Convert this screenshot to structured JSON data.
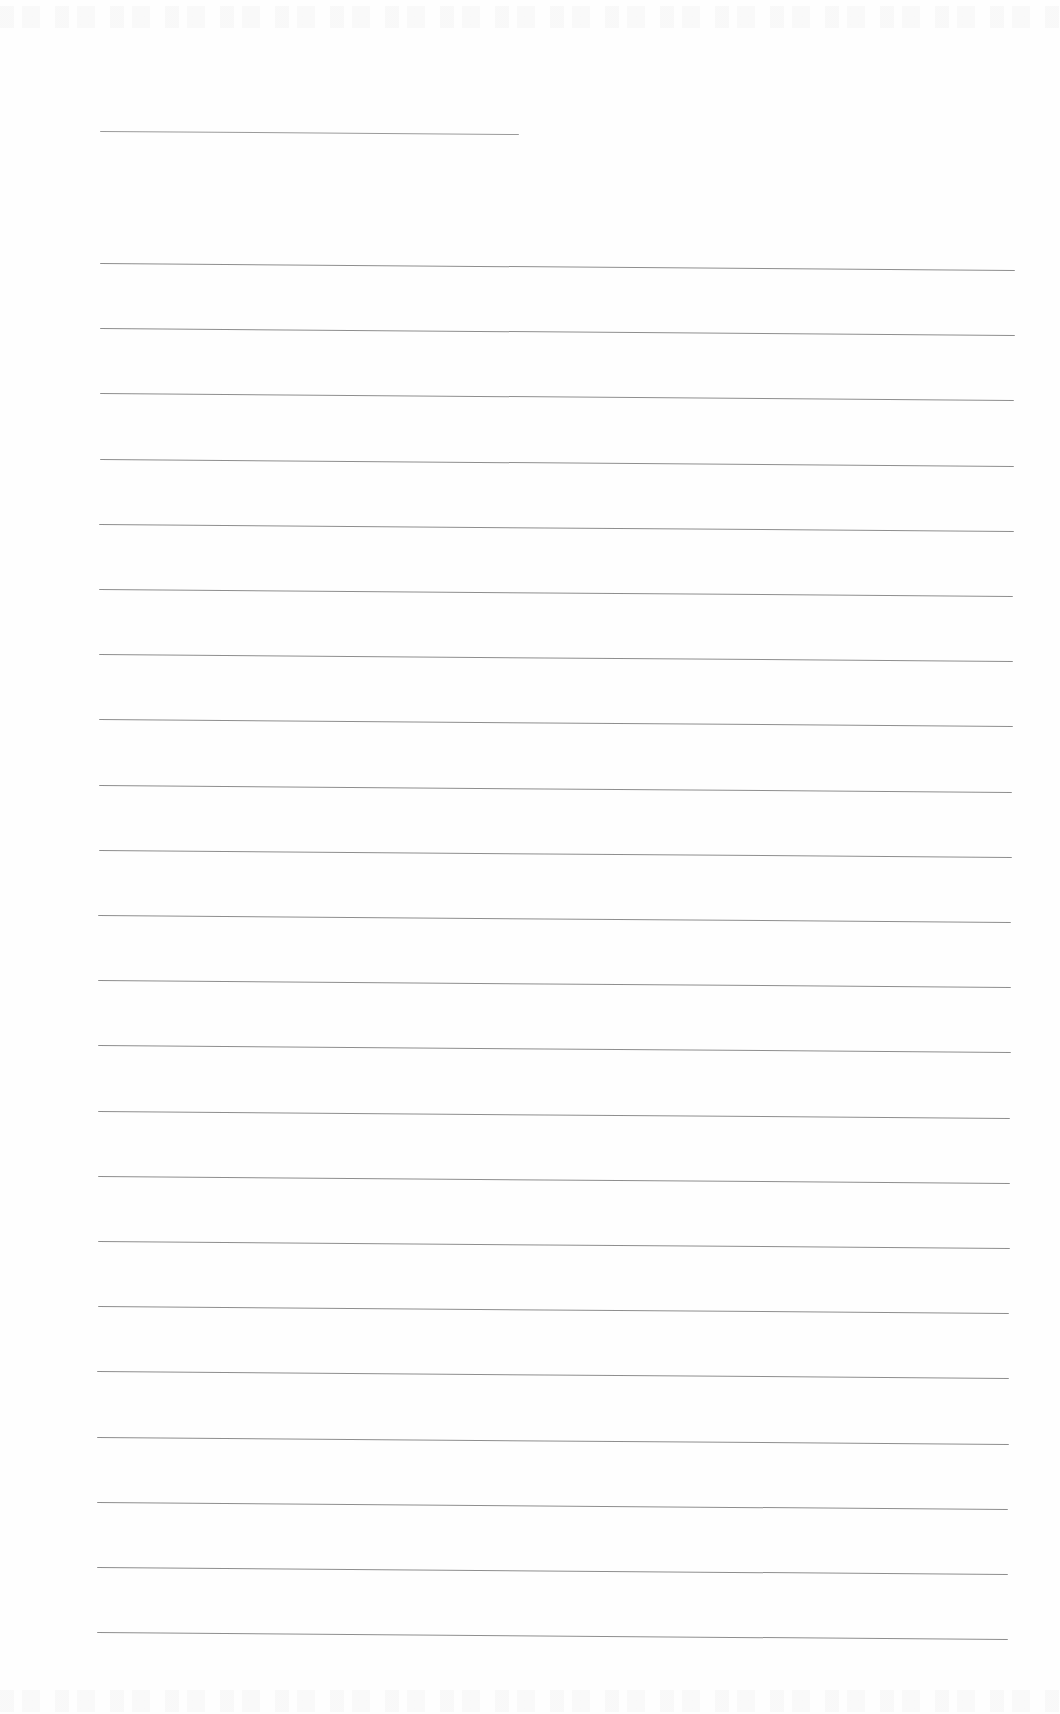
{
  "document": {
    "type": "blank lined writing paper (scanned)",
    "background_color": "#fefefe",
    "line_color": "#8e8e8e",
    "title_line": {
      "x1": 100,
      "y1": 131,
      "x2": 519,
      "y2": 134
    },
    "ruled_lines": {
      "count": 22,
      "x_start": 100,
      "x_end": 1015,
      "first_y": 263,
      "spacing": 65.2,
      "slope_px": 7
    },
    "written_text": ""
  }
}
